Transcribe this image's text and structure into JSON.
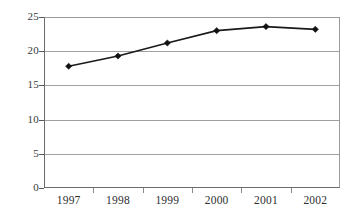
{
  "chart_data": {
    "type": "line",
    "title": "",
    "subtitle": "",
    "xlabel": "",
    "ylabel": "",
    "categories": [
      "1997",
      "1998",
      "1999",
      "2000",
      "2001",
      "2002"
    ],
    "values": [
      17.8,
      19.3,
      21.2,
      23.0,
      23.6,
      23.2
    ],
    "series": [
      {
        "name": "",
        "values": [
          17.8,
          19.3,
          21.2,
          23.0,
          23.6,
          23.2
        ]
      }
    ],
    "ylim": [
      0,
      25
    ],
    "yticks": [
      0,
      5,
      10,
      15,
      20,
      25
    ],
    "ytick_labels": [
      "0",
      "5",
      "10",
      "15",
      "20",
      "25"
    ],
    "xtick_labels": [
      "1997",
      "1998",
      "1999",
      "2000",
      "2001",
      "2002"
    ],
    "grid": true,
    "grid_axis": "y",
    "legend": false,
    "legend_position": "none",
    "marker": "diamond",
    "line_color": "#1a1a1a",
    "grid_color": "#a0a0a0",
    "background_color": "#ffffff",
    "annotations": []
  }
}
